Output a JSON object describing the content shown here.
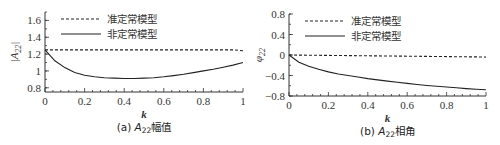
{
  "chart_data": [
    {
      "type": "line",
      "title": "(a) A22幅值",
      "caption_prefix": "(a) ",
      "caption_symbol": "A",
      "caption_sub": "22",
      "caption_suffix": "幅值",
      "xlabel": "k",
      "ylabel": "|A22|",
      "xlim": [
        0,
        1
      ],
      "ylim": [
        0.75,
        1.7
      ],
      "xticks": [
        "0",
        "0.2",
        "0.4",
        "0.6",
        "0.8",
        "1"
      ],
      "yticks": [
        "0.8",
        "1",
        "1.2",
        "1.4",
        "1.6"
      ],
      "legend_position": "upper-center",
      "x": [
        0,
        0.05,
        0.1,
        0.15,
        0.2,
        0.25,
        0.3,
        0.35,
        0.4,
        0.45,
        0.5,
        0.55,
        0.6,
        0.65,
        0.7,
        0.75,
        0.8,
        0.85,
        0.9,
        0.95,
        1.0
      ],
      "series": [
        {
          "name": "准定常模型",
          "style": "dashed",
          "values": [
            1.25,
            1.25,
            1.25,
            1.25,
            1.25,
            1.25,
            1.25,
            1.25,
            1.25,
            1.25,
            1.25,
            1.25,
            1.25,
            1.25,
            1.25,
            1.25,
            1.25,
            1.25,
            1.25,
            1.25,
            1.24
          ]
        },
        {
          "name": "非定常模型",
          "style": "solid",
          "values": [
            1.25,
            1.12,
            1.04,
            0.98,
            0.95,
            0.93,
            0.92,
            0.915,
            0.91,
            0.91,
            0.915,
            0.92,
            0.93,
            0.945,
            0.96,
            0.98,
            1.0,
            1.02,
            1.045,
            1.07,
            1.1
          ]
        }
      ]
    },
    {
      "type": "line",
      "title": "(b) A22相角",
      "caption_prefix": "(b) ",
      "caption_symbol": "A",
      "caption_sub": "22",
      "caption_suffix": "相角",
      "xlabel": "k",
      "ylabel": "φ22",
      "xlim": [
        0,
        1
      ],
      "ylim": [
        -0.8,
        0.8
      ],
      "xticks": [
        "0",
        "0.2",
        "0.4",
        "0.6",
        "0.8",
        "1"
      ],
      "yticks": [
        "-0.8",
        "-0.4",
        "0",
        "0.4",
        "0.8"
      ],
      "legend_position": "upper-center",
      "x": [
        0,
        0.05,
        0.1,
        0.15,
        0.2,
        0.25,
        0.3,
        0.35,
        0.4,
        0.45,
        0.5,
        0.55,
        0.6,
        0.65,
        0.7,
        0.75,
        0.8,
        0.85,
        0.9,
        0.95,
        1.0
      ],
      "series": [
        {
          "name": "准定常模型",
          "style": "dashed",
          "values": [
            0,
            -0.002,
            -0.004,
            -0.006,
            -0.008,
            -0.01,
            -0.012,
            -0.014,
            -0.016,
            -0.018,
            -0.02,
            -0.022,
            -0.024,
            -0.026,
            -0.028,
            -0.03,
            -0.032,
            -0.034,
            -0.036,
            -0.038,
            -0.04
          ]
        },
        {
          "name": "非定常模型",
          "style": "solid",
          "values": [
            0,
            -0.14,
            -0.22,
            -0.28,
            -0.33,
            -0.37,
            -0.4,
            -0.43,
            -0.46,
            -0.485,
            -0.51,
            -0.53,
            -0.555,
            -0.575,
            -0.595,
            -0.61,
            -0.625,
            -0.64,
            -0.655,
            -0.67,
            -0.68
          ]
        }
      ]
    }
  ]
}
